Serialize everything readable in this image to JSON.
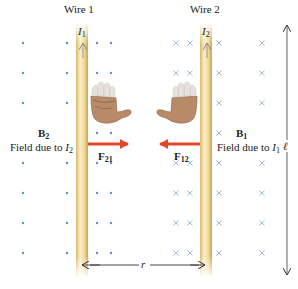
{
  "wires": [
    {
      "label": "Wire 1",
      "current": "I",
      "current_sub": "1",
      "x": 82
    },
    {
      "label": "Wire 2",
      "current": "I",
      "current_sub": "2",
      "x": 206
    }
  ],
  "fields": {
    "left": {
      "symbol": "B",
      "sub": "2",
      "desc": "Field due to ",
      "desc_var": "I",
      "desc_sub": "2",
      "marker": "dot"
    },
    "right": {
      "symbol": "B",
      "sub": "1",
      "desc": "Field due to ",
      "desc_var": "I",
      "desc_sub": "1",
      "marker": "cross"
    }
  },
  "forces": {
    "f21": {
      "symbol": "F",
      "sub": "21",
      "direction": "right"
    },
    "f12": {
      "symbol": "F",
      "sub": "12",
      "direction": "left"
    }
  },
  "dimensions": {
    "separation": "r",
    "length": "ℓ"
  },
  "colors": {
    "wire_fill": "#f2dca0",
    "wire_edge": "#d4b060",
    "field_marker": "#5a8fc8",
    "force_arrow": "#e04a2a",
    "skin": "#b98a68",
    "skin_shadow": "#8a5f45",
    "glove": "#e8e4dc",
    "text": "#222222"
  },
  "grid": {
    "rows": [
      43,
      73,
      103,
      133,
      163,
      193,
      223,
      253
    ],
    "dot_cols": [
      23,
      67,
      97,
      111
    ],
    "cross_cols": [
      176,
      190,
      219,
      262
    ]
  }
}
